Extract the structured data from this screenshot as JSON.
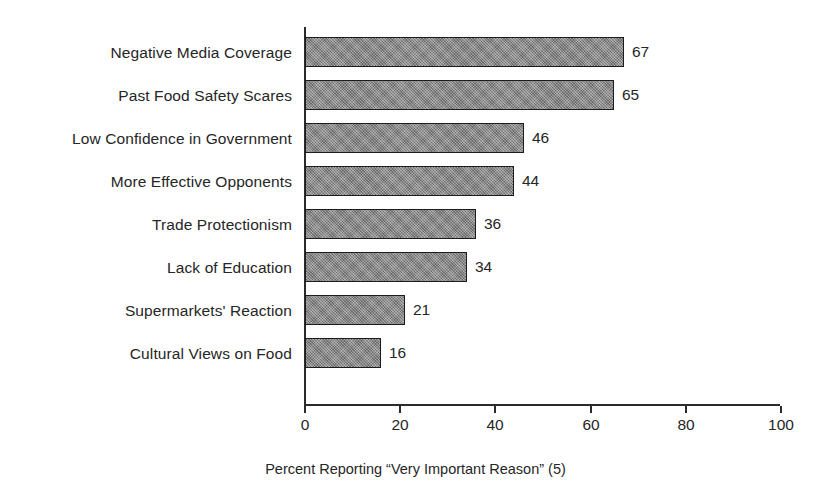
{
  "chart_data": {
    "type": "bar",
    "orientation": "horizontal",
    "title": "",
    "subtitle": "",
    "xlabel": "Percent Reporting “Very Important Reason” (5)",
    "ylabel": "",
    "categories": [
      "Negative Media Coverage",
      "Past Food Safety Scares",
      "Low Confidence in Government",
      "More Effective Opponents",
      "Trade Protectionism",
      "Lack of Education",
      "Supermarkets' Reaction",
      "Cultural Views on Food"
    ],
    "values": [
      67,
      65,
      46,
      44,
      36,
      34,
      21,
      16
    ],
    "value_labels": [
      "67",
      "65",
      "46",
      "44",
      "36",
      "34",
      "21",
      "16"
    ],
    "xlim": [
      0,
      100
    ],
    "xticks": [
      0,
      20,
      40,
      60,
      80,
      100
    ],
    "xtick_labels": [
      "0",
      "20",
      "40",
      "60",
      "80",
      "100"
    ],
    "grid": false,
    "legend": false,
    "legend_position": "none",
    "bar_fill_color": "#848484",
    "bar_edge_color": "#1c1c1c",
    "axis_color": "#2b2b2b",
    "text_color": "#262626",
    "background_color": "#ffffff"
  },
  "caption": {
    "text": "Percent Reporting “Very Important Reason” (5)"
  }
}
